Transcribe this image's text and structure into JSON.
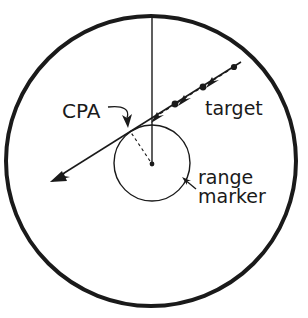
{
  "figure": {
    "name": "radar-cpa-diagram",
    "background_color": "#ffffff",
    "ink_color": "#1a1a1a"
  },
  "labels": {
    "cpa": "CPA",
    "target": "target",
    "range": "range",
    "marker": "marker"
  },
  "geometry": {
    "outer_circle": {
      "cx": 151,
      "cy": 161,
      "r": 145,
      "stroke_width": 4
    },
    "range_marker_circle": {
      "cx": 152,
      "cy": 163,
      "r": 38,
      "stroke_width": 1.4
    },
    "own_ship_center": {
      "cx": 152,
      "cy": 164,
      "r": 2.4
    },
    "heading_line": {
      "x1": 152,
      "y1": 16,
      "x2": 152,
      "y2": 164
    },
    "cpa_point": {
      "x": 129,
      "y": 130
    },
    "target_track_start": {
      "x": 236,
      "y": 66
    },
    "target_track_end": {
      "x": 54,
      "y": 180
    },
    "track_dots": [
      {
        "x": 234,
        "y": 67
      },
      {
        "x": 203,
        "y": 87
      },
      {
        "x": 175,
        "y": 104
      }
    ]
  },
  "annotations": {
    "cpa_leader": "cpa-leader-line",
    "range_marker_leader": "range-marker-leader-arrow"
  }
}
